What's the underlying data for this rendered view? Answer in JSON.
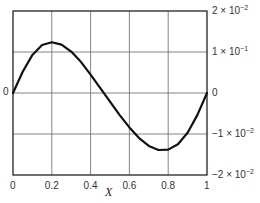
{
  "chart_data": {
    "type": "line",
    "title": "",
    "xlabel": "X",
    "ylabel": "",
    "xlim": [
      0,
      1
    ],
    "ylim": [
      -0.02,
      0.02
    ],
    "grid": true,
    "legend": null,
    "x_ticks": [
      0,
      0.2,
      0.4,
      0.6,
      0.8,
      1
    ],
    "x_tick_labels": [
      "0",
      "0.2",
      "0.4",
      "0.6",
      "0.8",
      "1"
    ],
    "left_y_tick_labels": [
      {
        "value": 0,
        "label": "0"
      }
    ],
    "right_y_ticks": [
      {
        "value": 0.02,
        "mantissa": "2 × 10",
        "exp": "−2"
      },
      {
        "value": 0.01,
        "mantissa": "1 × 10",
        "exp": "−1"
      },
      {
        "value": 0,
        "mantissa": "0",
        "exp": ""
      },
      {
        "value": -0.01,
        "mantissa": "−1 × 10",
        "exp": "−2"
      },
      {
        "value": -0.02,
        "mantissa": "−2 × 10",
        "exp": "−2"
      }
    ],
    "series": [
      {
        "name": "curve",
        "color": "#111111",
        "x": [
          0,
          0.05,
          0.1,
          0.15,
          0.2,
          0.25,
          0.3,
          0.35,
          0.4,
          0.45,
          0.5,
          0.55,
          0.6,
          0.65,
          0.7,
          0.75,
          0.8,
          0.85,
          0.9,
          0.95,
          1.0
        ],
        "y": [
          0,
          0.0052,
          0.0093,
          0.0117,
          0.0124,
          0.0118,
          0.0101,
          0.0076,
          0.0045,
          0.0012,
          -0.0021,
          -0.0054,
          -0.0084,
          -0.011,
          -0.0129,
          -0.0139,
          -0.0138,
          -0.0125,
          -0.0097,
          -0.0054,
          0
        ]
      }
    ]
  }
}
